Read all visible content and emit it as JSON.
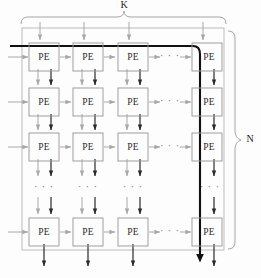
{
  "figure": {
    "type": "grid-dataflow-diagram",
    "canvas": {
      "width": 261,
      "height": 278
    }
  },
  "labels": {
    "top_brace": "K",
    "right_brace": "N",
    "pe": "PE",
    "ellipsis_horizontal": "· · ·",
    "ellipsis_vertical": "· · ·"
  },
  "grid": {
    "rows": 4,
    "cols": 4,
    "row_centers": [
      55,
      100,
      145,
      230
    ],
    "col_centers": [
      44,
      88,
      133,
      207
    ],
    "cell_w": 30,
    "cell_h": 28,
    "horizontal_ellipsis_x": 170,
    "vertical_ellipsis_y": 188,
    "pe_cells": [
      [
        {
          "label": "PE"
        },
        {
          "label": "PE"
        },
        {
          "label": "PE"
        },
        {
          "label": "PE"
        }
      ],
      [
        {
          "label": "PE"
        },
        {
          "label": "PE"
        },
        {
          "label": "PE"
        },
        {
          "label": "PE"
        }
      ],
      [
        {
          "label": "PE"
        },
        {
          "label": "PE"
        },
        {
          "label": "PE"
        },
        {
          "label": "PE"
        }
      ],
      [
        {
          "label": "PE"
        },
        {
          "label": "PE"
        },
        {
          "label": "PE"
        },
        {
          "label": "PE"
        }
      ]
    ]
  },
  "outer_box": {
    "x": 22,
    "y": 28,
    "width": 202,
    "height": 222
  },
  "braces": {
    "top": {
      "x1": 20,
      "x2": 226,
      "y": 22,
      "label_x": 124,
      "label_y": 5
    },
    "right": {
      "y1": 30,
      "y2": 250,
      "x": 232,
      "label_x": 250,
      "label_y": 140
    }
  },
  "highlight_path": {
    "description": "bold weight-stationary data path",
    "color": "#111111",
    "enters_left_x": 12,
    "row_y": 46,
    "turn_x": 200,
    "exits_bottom_y": 262
  },
  "colors": {
    "box_stroke": "#8f8f8f",
    "pe_stroke": "#9a9a9a",
    "arrow_light": "#a8a8a8",
    "arrow_dark": "#2a2a2a",
    "highlight": "#111111",
    "text": "#2b2b2b",
    "background": "#fdfdfd"
  }
}
